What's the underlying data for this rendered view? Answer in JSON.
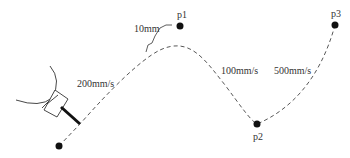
{
  "diagram": {
    "points": [
      {
        "id": "start",
        "label": "",
        "x": 59,
        "y": 146
      },
      {
        "id": "p1",
        "label": "p1",
        "x": 180,
        "y": 26
      },
      {
        "id": "p2",
        "label": "p2",
        "x": 257,
        "y": 124
      },
      {
        "id": "p3",
        "label": "p3",
        "x": 335,
        "y": 25
      }
    ],
    "speed_labels": {
      "segment1": "200mm/s",
      "segment2": "100mm/s",
      "segment3": "500mm/s"
    },
    "zone_label": "10mm",
    "colors": {
      "stroke": "#333333",
      "point": "#111111",
      "background": "#ffffff"
    }
  }
}
